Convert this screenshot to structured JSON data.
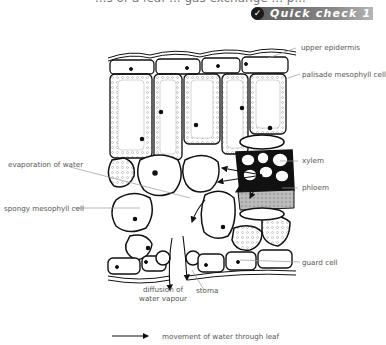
{
  "page": {
    "cut_heading": "...s of a leaf ... gas exchange ... p...",
    "badge": {
      "icon": "check-icon",
      "label": "Quick check 1",
      "colors": {
        "start": "#5a5a5a",
        "end": "#b5b5b5",
        "circle": "#1a1a1a"
      }
    }
  },
  "diagram": {
    "labels": {
      "upper_epidermis": "upper epidermis",
      "palisade": "palisade mesophyll cell",
      "xylem": "xylem",
      "phloem": "phloem",
      "evaporation": "evaporation of water",
      "spongy": "spongy mesophyll cell",
      "guard_cell": "guard cell",
      "diffusion_line1": "diffusion of",
      "diffusion_line2": "water vapour",
      "stoma": "stoma"
    },
    "legend": {
      "icon": "arrow-right-icon",
      "text": "movement of water through leaf"
    }
  }
}
